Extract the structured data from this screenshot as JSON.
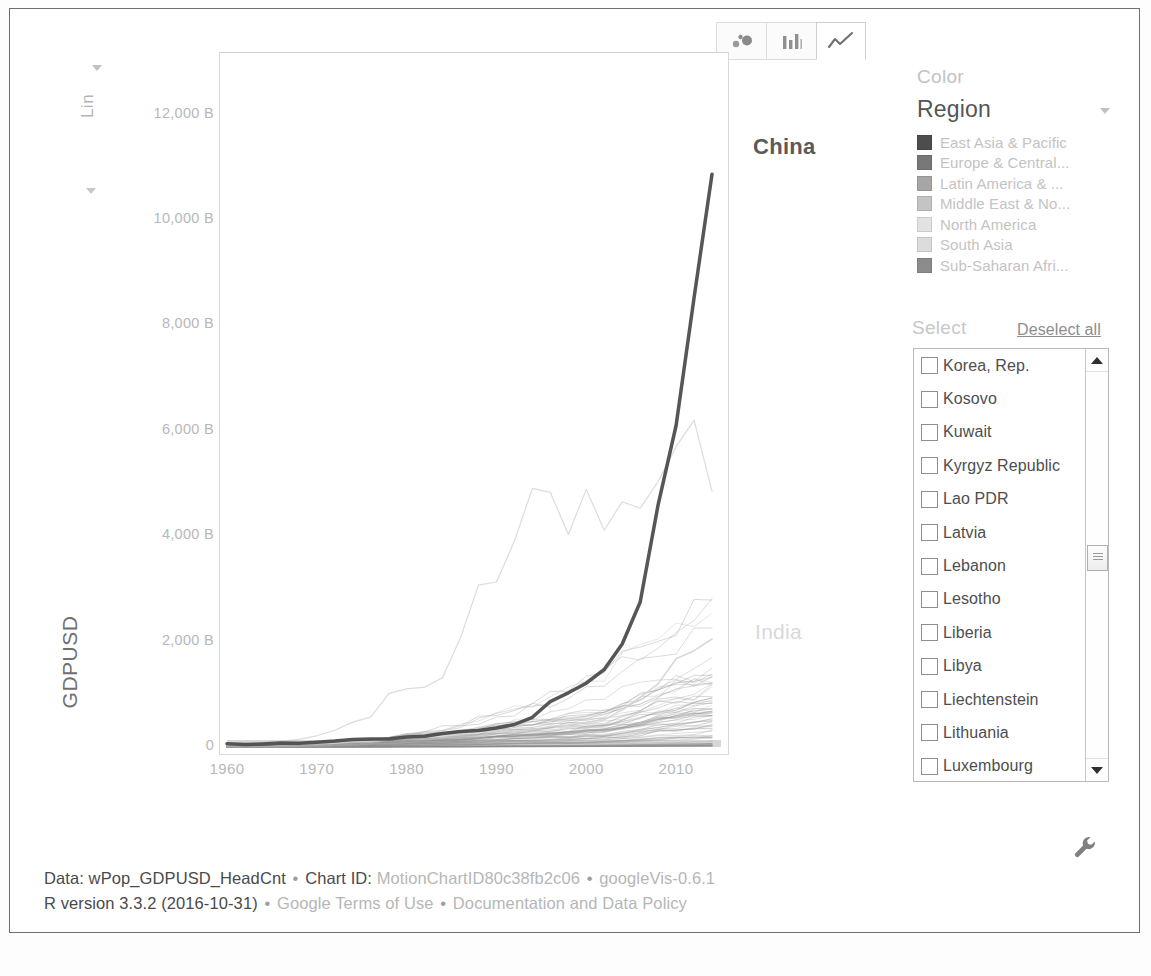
{
  "toolbar": {
    "buttons": [
      {
        "name": "bubble-chart",
        "label": "Bubble chart",
        "active": false
      },
      {
        "name": "bar-chart",
        "label": "Bar chart",
        "active": false
      },
      {
        "name": "line-chart",
        "label": "Line chart",
        "active": true
      }
    ]
  },
  "y_scale_control": {
    "label": "Lin",
    "caret": "chevron-down-icon"
  },
  "right_panel": {
    "color_heading": "Color",
    "color_variable": "Region",
    "legend": [
      {
        "label": "East Asia & Pacific",
        "color": "#4d4d4d"
      },
      {
        "label": "Europe & Central...",
        "color": "#787878"
      },
      {
        "label": "Latin America & ...",
        "color": "#a6a6a6"
      },
      {
        "label": "Middle East & No...",
        "color": "#c4c4c4"
      },
      {
        "label": "North America",
        "color": "#e2e2e2"
      },
      {
        "label": "South Asia",
        "color": "#dcdcdc"
      },
      {
        "label": "Sub-Saharan Afri...",
        "color": "#8c8c8c"
      }
    ],
    "select_heading": "Select",
    "deselect_all": "Deselect all",
    "select_items": [
      {
        "label": "Korea, Rep.",
        "checked": false
      },
      {
        "label": "Kosovo",
        "checked": false
      },
      {
        "label": "Kuwait",
        "checked": false
      },
      {
        "label": "Kyrgyz Republic",
        "checked": false
      },
      {
        "label": "Lao PDR",
        "checked": false
      },
      {
        "label": "Latvia",
        "checked": false
      },
      {
        "label": "Lebanon",
        "checked": false
      },
      {
        "label": "Lesotho",
        "checked": false
      },
      {
        "label": "Liberia",
        "checked": false
      },
      {
        "label": "Libya",
        "checked": false
      },
      {
        "label": "Liechtenstein",
        "checked": false
      },
      {
        "label": "Lithuania",
        "checked": false
      },
      {
        "label": "Luxembourg",
        "checked": false
      }
    ],
    "scroll_position_percent": 48
  },
  "footer": {
    "line1": [
      {
        "text": "Data: wPop_GDPUSD_HeadCnt",
        "dim": false
      },
      {
        "text": " • ",
        "sep": true
      },
      {
        "text": "Chart ID: ",
        "dim": false
      },
      {
        "text": "MotionChartID80c38fb2c06",
        "dim": true
      },
      {
        "text": " • ",
        "sep": true
      },
      {
        "text": "googleVis-0.6.1",
        "dim": true
      }
    ],
    "line2": [
      {
        "text": "R version 3.3.2 (2016-10-31)",
        "dim": false
      },
      {
        "text": " • ",
        "sep": true
      },
      {
        "text": "Google Terms of Use",
        "dim": true
      },
      {
        "text": " • ",
        "sep": true
      },
      {
        "text": "Documentation and Data Policy",
        "dim": true
      }
    ]
  },
  "settings": {
    "icon": "wrench-icon"
  },
  "chart_data": {
    "type": "line",
    "title": "",
    "xlabel": "",
    "ylabel": "GDPUSD",
    "xlim": [
      1960,
      2015
    ],
    "ylim": [
      0,
      13000
    ],
    "ytick_labels": [
      "0",
      "2,000 B",
      "4,000 B",
      "6,000 B",
      "8,000 B",
      "10,000 B",
      "12,000 B"
    ],
    "ytick_values": [
      0,
      2000,
      4000,
      6000,
      8000,
      10000,
      12000
    ],
    "xtick_labels": [
      "1960",
      "1970",
      "1980",
      "1990",
      "2000",
      "2010"
    ],
    "xtick_values": [
      1960,
      1970,
      1980,
      1990,
      2000,
      2010
    ],
    "grid": false,
    "legend_position": "right",
    "value_unit": "billion USD",
    "annotations": [
      {
        "text": "China",
        "x": 2014,
        "y": 11000,
        "emphasis": "bold"
      },
      {
        "text": "India",
        "x": 2014,
        "y": 2050,
        "emphasis": "faint"
      }
    ],
    "x": [
      1960,
      1962,
      1964,
      1966,
      1968,
      1970,
      1972,
      1974,
      1976,
      1978,
      1980,
      1982,
      1984,
      1986,
      1988,
      1990,
      1992,
      1994,
      1996,
      1998,
      2000,
      2002,
      2004,
      2006,
      2008,
      2010,
      2012,
      2014
    ],
    "series": [
      {
        "name": "China",
        "emphasis": "bold",
        "color": "#4d4d4d",
        "values": [
          60,
          47,
          59,
          76,
          70,
          92,
          113,
          144,
          153,
          150,
          191,
          205,
          259,
          297,
          312,
          360,
          427,
          564,
          864,
          1029,
          1211,
          1471,
          1955,
          2752,
          4594,
          6101,
          8532,
          10870
        ]
      },
      {
        "name": "Japan",
        "emphasis": "faint",
        "color": "#b9b9b9",
        "values": [
          44,
          60,
          82,
          106,
          147,
          213,
          319,
          473,
          565,
          1014,
          1105,
          1134,
          1318,
          2075,
          3072,
          3132,
          3908,
          4907,
          4834,
          4032,
          4888,
          4115,
          4656,
          4530,
          5038,
          5700,
          6203,
          4850
        ]
      },
      {
        "name": "India",
        "emphasis": "faint",
        "color": "#d2d2d2",
        "values": [
          37,
          42,
          56,
          46,
          53,
          62,
          71,
          99,
          102,
          137,
          186,
          201,
          212,
          248,
          297,
          321,
          288,
          333,
          392,
          416,
          468,
          514,
          709,
          940,
          1199,
          1676,
          1828,
          2050
        ]
      },
      {
        "name": "Other countries",
        "emphasis": "dense-bundle",
        "color": "#c8c8c8",
        "values": [
          20,
          24,
          30,
          38,
          47,
          60,
          85,
          120,
          150,
          200,
          260,
          290,
          310,
          340,
          400,
          480,
          520,
          560,
          600,
          640,
          700,
          760,
          900,
          1050,
          1250,
          1400,
          1500,
          1600
        ]
      }
    ]
  }
}
